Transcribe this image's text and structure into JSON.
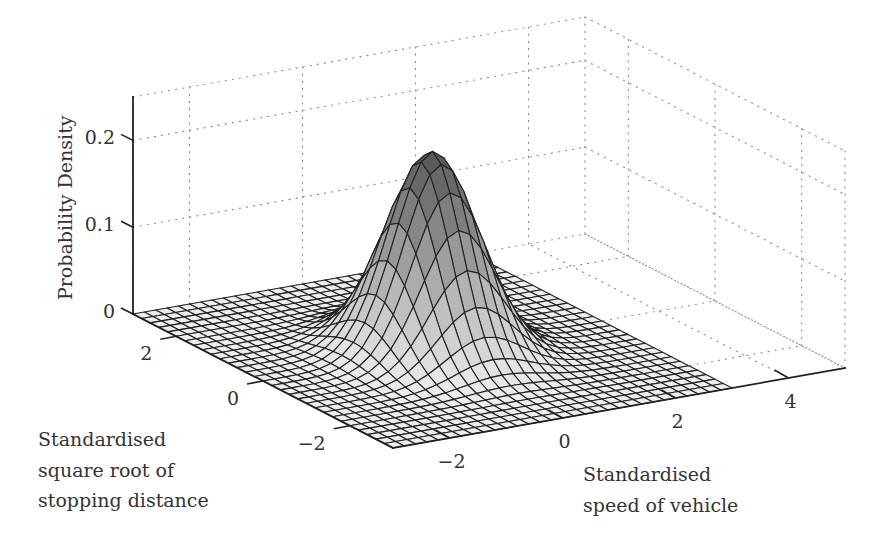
{
  "chart_data": {
    "type": "surface3d",
    "title": "",
    "xlabel": "Standardised speed of vehicle",
    "ylabel": "Standardised square root of stopping distance",
    "zlabel": "Probability Density",
    "xlabel_lines": [
      "Standardised",
      "speed of vehicle"
    ],
    "ylabel_lines": [
      "Standardised",
      "square root of",
      "stopping distance"
    ],
    "x_ticks": [
      -2,
      0,
      2,
      4
    ],
    "x_tick_labels": [
      "−2",
      "0",
      "2",
      "4"
    ],
    "y_ticks": [
      -2,
      0,
      2
    ],
    "y_tick_labels": [
      "−2",
      "0",
      "2"
    ],
    "z_ticks": [
      0,
      0.1,
      0.2
    ],
    "z_tick_labels": [
      "0",
      "0.1",
      "0.2"
    ],
    "xlim": [
      -3,
      5
    ],
    "ylim": [
      -3,
      3
    ],
    "zlim": [
      0,
      0.25
    ],
    "surface_domain": {
      "x": [
        -3,
        3
      ],
      "y": [
        -3,
        3
      ]
    },
    "distribution": "bivariate normal",
    "peak": {
      "x": 0,
      "y": 0,
      "z": 0.23
    },
    "contours_on_floor": true,
    "contour_count": 6,
    "grid": true,
    "grid_style": "dotted",
    "colormap": "gray"
  }
}
